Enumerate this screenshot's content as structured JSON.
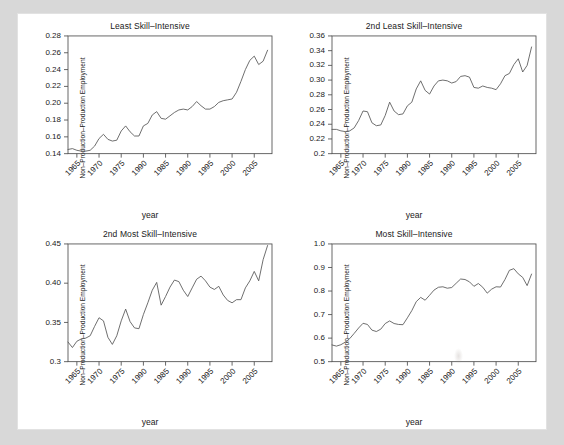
{
  "figure": {
    "background_color": "#d8d8d8",
    "panel_color": "#ffffff",
    "line_color": "#555555",
    "axis_color": "#4d4d4d"
  },
  "shared": {
    "xlabel": "year",
    "ylabel": "Non–Production–Production Employment",
    "xticks": [
      "1965",
      "1970",
      "1975",
      "1990",
      "1985",
      "1990",
      "1995",
      "2000",
      "2005"
    ],
    "xtick_values": [
      1965,
      1970,
      1975,
      1980,
      1985,
      1990,
      1995,
      2000,
      2005
    ],
    "xlim": [
      1963,
      2009
    ]
  },
  "chart_data": [
    {
      "type": "line",
      "panel": "top-left",
      "title": "Least Skill–Intensive",
      "xlabel": "year",
      "ylabel": "Non–Production–Production Employment",
      "xlim": [
        1963,
        2009
      ],
      "ylim": [
        0.14,
        0.28
      ],
      "yticks": [
        0.14,
        0.16,
        0.18,
        0.2,
        0.22,
        0.24,
        0.26,
        0.28
      ],
      "ytick_labels": [
        "0.14",
        "0.16",
        "0.18",
        "0.20",
        "0.22",
        "0.24",
        "0.26",
        "0.28"
      ],
      "grid": false,
      "legend": "none",
      "x": [
        1963,
        1964,
        1965,
        1966,
        1967,
        1968,
        1969,
        1970,
        1971,
        1972,
        1973,
        1974,
        1975,
        1976,
        1977,
        1978,
        1979,
        1980,
        1981,
        1982,
        1983,
        1984,
        1985,
        1986,
        1987,
        1988,
        1989,
        1990,
        1991,
        1992,
        1993,
        1994,
        1995,
        1996,
        1997,
        1998,
        1999,
        2000,
        2001,
        2002,
        2003,
        2004,
        2005,
        2006,
        2007,
        2008
      ],
      "y": [
        0.145,
        0.146,
        0.144,
        0.143,
        0.143,
        0.144,
        0.149,
        0.158,
        0.163,
        0.157,
        0.155,
        0.156,
        0.167,
        0.173,
        0.166,
        0.161,
        0.161,
        0.173,
        0.176,
        0.186,
        0.19,
        0.182,
        0.181,
        0.185,
        0.189,
        0.192,
        0.193,
        0.192,
        0.196,
        0.202,
        0.197,
        0.193,
        0.193,
        0.196,
        0.201,
        0.203,
        0.204,
        0.205,
        0.213,
        0.226,
        0.24,
        0.251,
        0.256,
        0.246,
        0.25,
        0.263
      ]
    },
    {
      "type": "line",
      "panel": "top-right",
      "title": "2nd Least Skill–Intensive",
      "xlabel": "year",
      "ylabel": "Non–Production–Production Employment",
      "xlim": [
        1963,
        2009
      ],
      "ylim": [
        0.2,
        0.36
      ],
      "yticks": [
        0.2,
        0.22,
        0.24,
        0.26,
        0.28,
        0.3,
        0.32,
        0.34,
        0.36
      ],
      "ytick_labels": [
        "0.2",
        "0.22",
        "0.24",
        "0.26",
        "0.28",
        "0.30",
        "0.32",
        "0.34",
        "0.36"
      ],
      "grid": false,
      "legend": "none",
      "x": [
        1963,
        1964,
        1965,
        1966,
        1967,
        1968,
        1969,
        1970,
        1971,
        1972,
        1973,
        1974,
        1975,
        1976,
        1977,
        1978,
        1979,
        1980,
        1981,
        1982,
        1983,
        1984,
        1985,
        1986,
        1987,
        1988,
        1989,
        1990,
        1991,
        1992,
        1993,
        1994,
        1995,
        1996,
        1997,
        1998,
        1999,
        2000,
        2001,
        2002,
        2003,
        2004,
        2005,
        2006,
        2007,
        2008
      ],
      "y": [
        0.233,
        0.233,
        0.231,
        0.23,
        0.231,
        0.235,
        0.245,
        0.258,
        0.257,
        0.242,
        0.238,
        0.239,
        0.252,
        0.27,
        0.258,
        0.253,
        0.254,
        0.265,
        0.27,
        0.288,
        0.299,
        0.286,
        0.281,
        0.292,
        0.299,
        0.3,
        0.299,
        0.296,
        0.298,
        0.305,
        0.306,
        0.304,
        0.29,
        0.289,
        0.292,
        0.29,
        0.289,
        0.287,
        0.295,
        0.306,
        0.309,
        0.321,
        0.329,
        0.311,
        0.32,
        0.345
      ]
    },
    {
      "type": "line",
      "panel": "bottom-left",
      "title": "2nd Most Skill–Intensive",
      "xlabel": "year",
      "ylabel": "Non–Production–Production Employment",
      "xlim": [
        1963,
        2009
      ],
      "ylim": [
        0.3,
        0.45
      ],
      "yticks": [
        0.3,
        0.35,
        0.4,
        0.45
      ],
      "ytick_labels": [
        "0.3",
        "0.35",
        "0.40",
        "0.45"
      ],
      "grid": false,
      "legend": "none",
      "x": [
        1963,
        1964,
        1965,
        1966,
        1967,
        1968,
        1969,
        1970,
        1971,
        1972,
        1973,
        1974,
        1975,
        1976,
        1977,
        1978,
        1979,
        1980,
        1981,
        1982,
        1983,
        1984,
        1985,
        1986,
        1987,
        1988,
        1989,
        1990,
        1991,
        1992,
        1993,
        1994,
        1995,
        1996,
        1997,
        1998,
        1999,
        2000,
        2001,
        2002,
        2003,
        2004,
        2005,
        2006,
        2007,
        2008
      ],
      "y": [
        0.325,
        0.318,
        0.326,
        0.329,
        0.33,
        0.333,
        0.345,
        0.356,
        0.352,
        0.331,
        0.322,
        0.333,
        0.352,
        0.367,
        0.351,
        0.343,
        0.342,
        0.36,
        0.375,
        0.391,
        0.401,
        0.372,
        0.383,
        0.395,
        0.404,
        0.402,
        0.391,
        0.383,
        0.394,
        0.405,
        0.409,
        0.403,
        0.395,
        0.392,
        0.396,
        0.385,
        0.378,
        0.375,
        0.379,
        0.379,
        0.394,
        0.403,
        0.415,
        0.403,
        0.43,
        0.448
      ]
    },
    {
      "type": "line",
      "panel": "bottom-right",
      "title": "Most Skill–Intensive",
      "xlabel": "year",
      "ylabel": "Non–Production–Production Employment",
      "xlim": [
        1963,
        2009
      ],
      "ylim": [
        0.5,
        1.0
      ],
      "yticks": [
        0.5,
        0.6,
        0.7,
        0.8,
        0.9,
        1.0
      ],
      "ytick_labels": [
        "0.5",
        "0.6",
        "0.7",
        "0.8",
        "0.9",
        "1.0"
      ],
      "grid": false,
      "legend": "none",
      "x": [
        1963,
        1964,
        1965,
        1966,
        1967,
        1968,
        1969,
        1970,
        1971,
        1972,
        1973,
        1974,
        1975,
        1976,
        1977,
        1978,
        1979,
        1980,
        1981,
        1982,
        1983,
        1984,
        1985,
        1986,
        1987,
        1988,
        1989,
        1990,
        1991,
        1992,
        1993,
        1994,
        1995,
        1996,
        1997,
        1998,
        1999,
        2000,
        2001,
        2002,
        2003,
        2004,
        2005,
        2006,
        2007,
        2008
      ],
      "y": [
        0.571,
        0.566,
        0.572,
        0.583,
        0.598,
        0.62,
        0.643,
        0.663,
        0.658,
        0.634,
        0.628,
        0.638,
        0.662,
        0.673,
        0.662,
        0.658,
        0.657,
        0.686,
        0.717,
        0.755,
        0.773,
        0.761,
        0.782,
        0.804,
        0.816,
        0.818,
        0.812,
        0.815,
        0.833,
        0.851,
        0.849,
        0.839,
        0.82,
        0.832,
        0.816,
        0.791,
        0.808,
        0.818,
        0.817,
        0.849,
        0.888,
        0.895,
        0.873,
        0.858,
        0.823,
        0.872
      ]
    }
  ]
}
